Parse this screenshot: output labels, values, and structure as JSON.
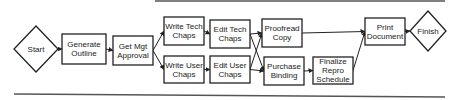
{
  "diagram": {
    "type": "flowchart",
    "nodes": [
      {
        "id": "start",
        "shape": "diamond",
        "lines": [
          "Start"
        ]
      },
      {
        "id": "outline",
        "shape": "box",
        "lines": [
          "Generate",
          "Outline"
        ]
      },
      {
        "id": "approval",
        "shape": "box",
        "lines": [
          "Get Mgt",
          "Approval"
        ]
      },
      {
        "id": "writeTech",
        "shape": "box",
        "lines": [
          "Write Tech",
          "Chaps"
        ]
      },
      {
        "id": "writeUser",
        "shape": "box",
        "lines": [
          "Write User",
          "Chaps"
        ]
      },
      {
        "id": "editTech",
        "shape": "box",
        "lines": [
          "Edit Tech",
          "Chaps"
        ]
      },
      {
        "id": "editUser",
        "shape": "box",
        "lines": [
          "Edit User",
          "Chaps"
        ]
      },
      {
        "id": "proofread",
        "shape": "box",
        "lines": [
          "Proofread",
          "Copy"
        ]
      },
      {
        "id": "binding",
        "shape": "box",
        "lines": [
          "Purchase",
          "Binding"
        ]
      },
      {
        "id": "repro",
        "shape": "box",
        "lines": [
          "Finalize",
          "Repro",
          "Schedule"
        ]
      },
      {
        "id": "print",
        "shape": "box",
        "lines": [
          "Print",
          "Document"
        ]
      },
      {
        "id": "finish",
        "shape": "diamond",
        "lines": [
          "Finish"
        ]
      }
    ],
    "edges": [
      [
        "start",
        "outline"
      ],
      [
        "outline",
        "approval"
      ],
      [
        "approval",
        "writeTech"
      ],
      [
        "approval",
        "writeUser"
      ],
      [
        "writeTech",
        "editTech"
      ],
      [
        "writeUser",
        "editUser"
      ],
      [
        "editTech",
        "proofread"
      ],
      [
        "editTech",
        "binding"
      ],
      [
        "editUser",
        "proofread"
      ],
      [
        "editUser",
        "binding"
      ],
      [
        "binding",
        "repro"
      ],
      [
        "proofread",
        "print"
      ],
      [
        "repro",
        "print"
      ],
      [
        "print",
        "finish"
      ]
    ]
  }
}
